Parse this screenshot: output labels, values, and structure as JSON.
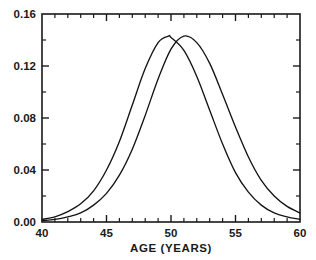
{
  "chart_data": {
    "type": "line",
    "title": "",
    "subtitle": "",
    "xlabel": "AGE (YEARS)",
    "ylabel": "",
    "xlim": [
      40,
      60
    ],
    "ylim": [
      0.0,
      0.16
    ],
    "grid": false,
    "legend": null,
    "x_ticks": [
      40,
      45,
      50,
      55,
      60
    ],
    "x_tick_labels": [
      "40",
      "45",
      "50",
      "55",
      "60"
    ],
    "x_minor_tick_step": 1,
    "y_ticks": [
      0.0,
      0.04,
      0.08,
      0.12,
      0.16
    ],
    "y_tick_labels": [
      "0.00",
      "0.04",
      "0.08",
      "0.12",
      "0.16"
    ],
    "y_minor_tick_step": 0.02,
    "series": [
      {
        "name": "curve-1",
        "peak_x": 49.8,
        "peak_y": 0.143,
        "x": [
          40,
          41,
          42,
          43,
          44,
          45,
          46,
          47,
          48,
          49,
          49.8,
          50,
          51,
          52,
          53,
          54,
          55,
          56,
          57,
          58,
          59,
          60
        ],
        "values": [
          0.002,
          0.004,
          0.008,
          0.014,
          0.024,
          0.04,
          0.062,
          0.09,
          0.118,
          0.138,
          0.143,
          0.142,
          0.132,
          0.112,
          0.086,
          0.06,
          0.038,
          0.023,
          0.013,
          0.007,
          0.004,
          0.002
        ]
      },
      {
        "name": "curve-2",
        "peak_x": 51.0,
        "peak_y": 0.143,
        "x": [
          40,
          41,
          42,
          43,
          44,
          45,
          46,
          47,
          48,
          49,
          50,
          51,
          52,
          53,
          54,
          55,
          56,
          57,
          58,
          59,
          60
        ],
        "values": [
          0.001,
          0.002,
          0.004,
          0.007,
          0.013,
          0.022,
          0.036,
          0.056,
          0.082,
          0.11,
          0.133,
          0.143,
          0.138,
          0.122,
          0.098,
          0.073,
          0.05,
          0.032,
          0.02,
          0.012,
          0.007
        ]
      }
    ]
  },
  "axes": {
    "x_axis_label": "AGE (YEARS)",
    "y_axis_label": ""
  },
  "colors": {
    "curve": "#141414",
    "frame": "#1a1a1a",
    "background": "#ffffff",
    "text": "#1a1a1a"
  }
}
